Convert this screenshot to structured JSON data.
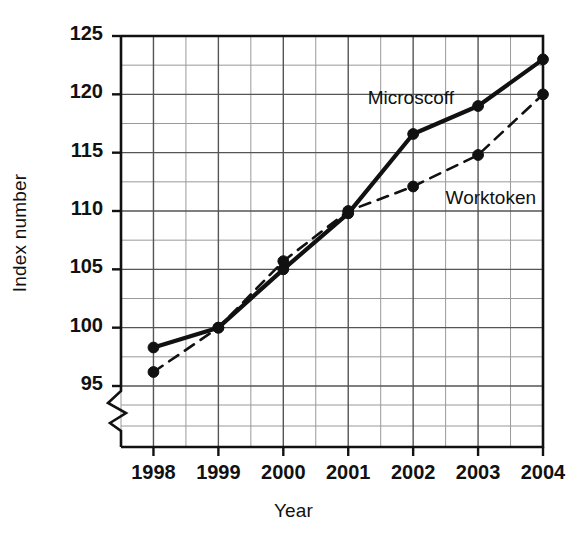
{
  "chart_data": {
    "type": "line",
    "title": "",
    "xlabel": "Year",
    "ylabel": "Index number",
    "categories": [
      "1998",
      "1999",
      "2000",
      "2001",
      "2002",
      "2003",
      "2004"
    ],
    "x": [
      1998,
      1999,
      2000,
      2001,
      2002,
      2003,
      2004
    ],
    "xlim": [
      1997.5,
      2004.0
    ],
    "ylim": [
      95,
      125
    ],
    "y_ticks": [
      95,
      100,
      105,
      110,
      115,
      120,
      125
    ],
    "y_tick_labels": [
      "95",
      "100",
      "105",
      "110",
      "115",
      "120",
      "125"
    ],
    "grid": true,
    "grid_minor": true,
    "axis_break": "y-axis broken below 95",
    "legend_position": "inline-labels",
    "series": [
      {
        "name": "Microscoff",
        "style": "solid",
        "marker": "filled-circle",
        "values": [
          98.3,
          100.0,
          105.0,
          109.8,
          116.6,
          119.0,
          123.0
        ]
      },
      {
        "name": "Worktoken",
        "style": "dashed",
        "marker": "filled-circle",
        "values": [
          96.2,
          100.0,
          105.7,
          110.0,
          112.1,
          114.8,
          120.0
        ]
      }
    ],
    "annotations": [
      {
        "text": "Microscoff",
        "x": 2001.3,
        "y": 119.6
      },
      {
        "text": "Worktoken",
        "x": 2002.5,
        "y": 111.0
      }
    ]
  },
  "colors": {
    "ink": "#111111",
    "grid": "#555555",
    "grid_minor": "#999999",
    "background": "#ffffff"
  }
}
